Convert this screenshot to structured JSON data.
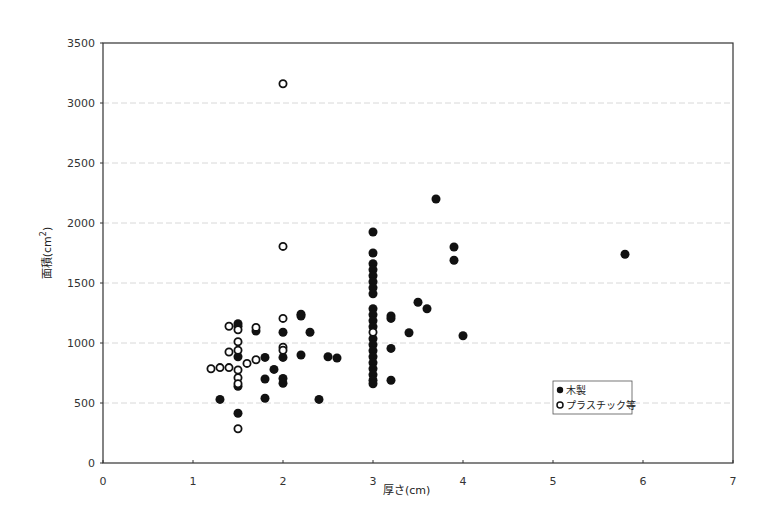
{
  "chart_data": {
    "type": "scatter",
    "title": "",
    "xlabel": "厚さ(cm)",
    "ylabel": "面積(cm²)",
    "ylabel_base": "面積(cm",
    "ylabel_sup": "2",
    "ylabel_close": ")",
    "xlim": [
      0,
      7
    ],
    "ylim": [
      0,
      3500
    ],
    "x_ticks": [
      0,
      1,
      2,
      3,
      4,
      5,
      6,
      7
    ],
    "y_ticks": [
      0,
      500,
      1000,
      1500,
      2000,
      2500,
      3000,
      3500
    ],
    "grid": {
      "y": true,
      "x": false,
      "color": "#d8d8d8"
    },
    "legend": {
      "position": "inside-lower-right"
    },
    "series": [
      {
        "name": "木製",
        "marker": "filled-circle",
        "color": "#111111",
        "points": [
          [
            1.3,
            530
          ],
          [
            1.5,
            1160
          ],
          [
            1.5,
            1140
          ],
          [
            1.5,
            885
          ],
          [
            1.5,
            640
          ],
          [
            1.5,
            415
          ],
          [
            1.7,
            1100
          ],
          [
            1.8,
            880
          ],
          [
            1.8,
            700
          ],
          [
            1.8,
            540
          ],
          [
            1.9,
            780
          ],
          [
            2.0,
            1090
          ],
          [
            2.0,
            880
          ],
          [
            2.0,
            705
          ],
          [
            2.0,
            665
          ],
          [
            2.2,
            1240
          ],
          [
            2.2,
            1225
          ],
          [
            2.2,
            900
          ],
          [
            2.3,
            1090
          ],
          [
            2.4,
            530
          ],
          [
            2.5,
            885
          ],
          [
            2.6,
            875
          ],
          [
            3.0,
            1925
          ],
          [
            3.0,
            1750
          ],
          [
            3.0,
            1660
          ],
          [
            3.0,
            1610
          ],
          [
            3.0,
            1560
          ],
          [
            3.0,
            1510
          ],
          [
            3.0,
            1460
          ],
          [
            3.0,
            1410
          ],
          [
            3.0,
            1285
          ],
          [
            3.0,
            1235
          ],
          [
            3.0,
            1185
          ],
          [
            3.0,
            1135
          ],
          [
            3.0,
            1035
          ],
          [
            3.0,
            985
          ],
          [
            3.0,
            935
          ],
          [
            3.0,
            885
          ],
          [
            3.0,
            835
          ],
          [
            3.0,
            785
          ],
          [
            3.0,
            735
          ],
          [
            3.0,
            690
          ],
          [
            3.0,
            660
          ],
          [
            3.2,
            1225
          ],
          [
            3.2,
            1205
          ],
          [
            3.2,
            955
          ],
          [
            3.2,
            690
          ],
          [
            3.4,
            1085
          ],
          [
            3.5,
            1340
          ],
          [
            3.6,
            1285
          ],
          [
            3.7,
            2200
          ],
          [
            3.9,
            1800
          ],
          [
            3.9,
            1690
          ],
          [
            4.0,
            1060
          ],
          [
            5.8,
            1740
          ]
        ]
      },
      {
        "name": "プラスチック等",
        "marker": "hollow-circle",
        "color": "#111111",
        "points": [
          [
            1.2,
            785
          ],
          [
            1.3,
            795
          ],
          [
            1.4,
            1140
          ],
          [
            1.4,
            925
          ],
          [
            1.4,
            795
          ],
          [
            1.5,
            1110
          ],
          [
            1.5,
            1010
          ],
          [
            1.5,
            940
          ],
          [
            1.5,
            775
          ],
          [
            1.5,
            710
          ],
          [
            1.5,
            660
          ],
          [
            1.5,
            285
          ],
          [
            1.6,
            830
          ],
          [
            1.7,
            1130
          ],
          [
            1.7,
            860
          ],
          [
            2.0,
            3160
          ],
          [
            2.0,
            1805
          ],
          [
            2.0,
            1205
          ],
          [
            2.0,
            965
          ],
          [
            2.0,
            940
          ],
          [
            3.0,
            1090
          ]
        ]
      }
    ]
  },
  "legend": {
    "items": [
      {
        "symbol": "●",
        "label": "木製"
      },
      {
        "symbol": "○",
        "label": "プラスチック等"
      }
    ]
  }
}
